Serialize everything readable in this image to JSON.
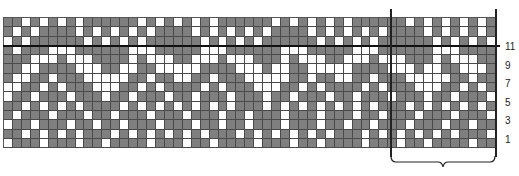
{
  "chart": {
    "columns": 55,
    "rows": 14,
    "colors": {
      "contrast": "#7f7f7f",
      "background": "#ffffff",
      "gridline": "#4a4a4a",
      "rule": "#111111"
    },
    "grid_rows_top_to_bottom": [
      "GGWGWGWGWGGGGGGWGWGWGWGWGGGGGGWGWGWGWGWGGGGGGWGWGWGWGWG",
      "GWGWGGGGWGWGWGWGWGGGGWGWGWGWGWGGGGWGWGWGWGWGGGGWGWGWGWG",
      "WGWGGGGGGWGWGWGWGGGGGGWGWGWGWGGGGGGWGWGWGWGGGGGGWGWGWGW",
      "GWGGGWWWGGGGGGWWWGGGGGWWWGGGGGGWWWGGGGGWWWGGGGGGWWWGGGG",
      "GGGWWWGWWWGGGGWGWWWGGWWWGWWWGGGWGWWWGGWWWGWWWGGGWGWWWGG",
      "GGWWGGGGWWWGGWWGGWWWWWGGGGWWWGWWGGWWWWWGGGGWWWGWWGGWWWG",
      "GWWGGWGGGWWWWWGGWGGWWGGWGGGWWWWWGGWGGWWGGWGGGWWWWWGGWGG",
      "WWGGWGWGGGWWWGGWGWGGGGWGWGGGWWWGGWGWGGGGWGWGGGWWWGGWGWG",
      "WGGWGGGWGGGWGGWGGGWGGWGGGWGGGWGGWGGGWGGWGGGWGGGWGGWGGGW",
      "GGWGWGWGWGGGGWGWGWGWGWGWGWGGGWGWGWGWGWGWGWGGGWGWGWGWGWG",
      "GWGGGWGGGWGGWGGGWGGGWGGGWGGWGGGWGGGWGGGWGGWGGGWGGGWGGGW",
      "WGGWGGGWGGWGGWGGGWGGGWGGWGGWGGGWGGGWGGWGGWGGGWGGGWGGWGG",
      "GGWGWGWGWGGGWGWGWGWGWGWGGGWGWGWGWGWGWGGGWGWGWGWGWGWGGGW",
      "WGGGWGGGWGGWGGGGWGGGWGGWGGGGWGGGWGGWGGGGWGGGWGGWGGGGWGG"
    ],
    "row_labels": [
      "11",
      "9",
      "7",
      "5",
      "3",
      "1"
    ],
    "repeat": {
      "start_col": 44,
      "end_col": 55,
      "label": ""
    }
  }
}
